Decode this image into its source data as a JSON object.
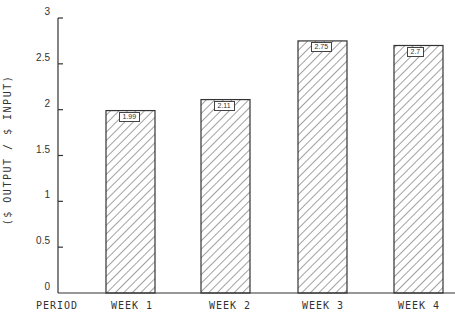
{
  "chart_data": {
    "type": "bar",
    "title": "",
    "xlabel": "PERIOD",
    "ylabel": "($ OUTPUT / $ INPUT)",
    "categories": [
      "WEEK 1",
      "WEEK 2",
      "WEEK 3",
      "WEEK 4"
    ],
    "values": [
      1.99,
      2.11,
      2.75,
      2.7
    ],
    "value_labels": [
      "1.99",
      "2.11",
      "2.75",
      "2.7"
    ],
    "ylim": [
      0,
      3
    ],
    "yticks": [
      0,
      0.5,
      1,
      1.5,
      2,
      2.5,
      3
    ],
    "ytick_labels": [
      "0",
      "0.5",
      "1",
      "1.5",
      "2",
      "2.5",
      "3"
    ],
    "grid": false,
    "legend": null,
    "bar_fill": "diagonal-hatch",
    "colors": {
      "line": "#333333",
      "background": "#ffffff"
    }
  },
  "axis": {
    "x_title": "PERIOD",
    "y_title": "($ OUTPUT / $ INPUT)"
  }
}
